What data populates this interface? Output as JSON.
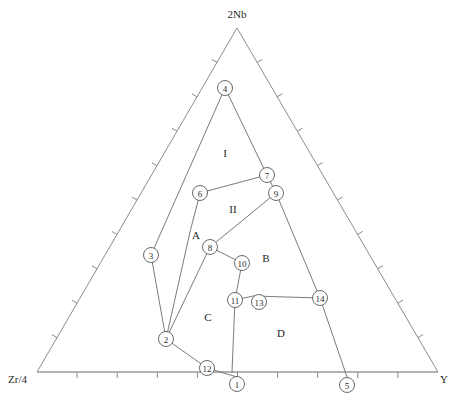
{
  "figure": {
    "kind": "ternary-phase-diagram",
    "background_color": "#ffffff",
    "line_color": "#6b6b6b",
    "edge_color": "#8c8c8c"
  },
  "corners": {
    "apex": {
      "label": "2Nb",
      "x": 237,
      "y": 14
    },
    "left": {
      "label": "Zr/4",
      "x": 8,
      "y": 379
    },
    "right": {
      "label": "Y",
      "x": 448,
      "y": 379
    }
  },
  "triangle": {
    "apex": {
      "x": 237,
      "y": 28
    },
    "left": {
      "x": 37,
      "y": 372
    },
    "right": {
      "x": 438,
      "y": 372
    },
    "tick_divisions": 10,
    "tick_length": 6
  },
  "region_labels": [
    {
      "text": "I",
      "x": 225,
      "y": 153
    },
    {
      "text": "II",
      "x": 233,
      "y": 209
    },
    {
      "text": "A",
      "x": 196,
      "y": 235
    },
    {
      "text": "B",
      "x": 266,
      "y": 258
    },
    {
      "text": "C",
      "x": 208,
      "y": 317
    },
    {
      "text": "D",
      "x": 281,
      "y": 333
    }
  ],
  "nodes": [
    {
      "id": "1",
      "x": 237,
      "y": 384,
      "r": 7.5
    },
    {
      "id": "2",
      "x": 166,
      "y": 339,
      "r": 7.5
    },
    {
      "id": "3",
      "x": 151,
      "y": 255,
      "r": 7.5
    },
    {
      "id": "4",
      "x": 225,
      "y": 88,
      "r": 7.5
    },
    {
      "id": "5",
      "x": 347,
      "y": 385,
      "r": 7.5
    },
    {
      "id": "6",
      "x": 200,
      "y": 193,
      "r": 7.5
    },
    {
      "id": "7",
      "x": 267,
      "y": 175,
      "r": 7.5
    },
    {
      "id": "8",
      "x": 210,
      "y": 247,
      "r": 7.5
    },
    {
      "id": "9",
      "x": 276,
      "y": 193,
      "r": 7.5
    },
    {
      "id": "10",
      "x": 242,
      "y": 263,
      "r": 7.5
    },
    {
      "id": "11",
      "x": 235,
      "y": 300,
      "r": 7.5
    },
    {
      "id": "12",
      "x": 207,
      "y": 368,
      "r": 7.5
    },
    {
      "id": "13",
      "x": 259,
      "y": 302,
      "r": 7.5
    },
    {
      "id": "14",
      "x": 320,
      "y": 298,
      "r": 7.5
    }
  ],
  "boundaries": [
    {
      "name": "apex-4-to-3-to-2",
      "points": [
        [
          225,
          88
        ],
        [
          151,
          255
        ],
        [
          166,
          339
        ]
      ]
    },
    {
      "name": "node4-to-node7-to-node9",
      "points": [
        [
          225,
          88
        ],
        [
          267,
          175
        ],
        [
          276,
          193
        ]
      ]
    },
    {
      "name": "node6-to-node7",
      "points": [
        [
          200,
          193
        ],
        [
          267,
          175
        ]
      ]
    },
    {
      "name": "node6-to-node2",
      "points": [
        [
          200,
          193
        ],
        [
          190,
          232
        ],
        [
          166,
          339
        ]
      ]
    },
    {
      "name": "node9-to-node8-to-node2",
      "points": [
        [
          276,
          193
        ],
        [
          210,
          247
        ],
        [
          166,
          339
        ]
      ]
    },
    {
      "name": "node9-to-node14-to-node5",
      "points": [
        [
          276,
          193
        ],
        [
          320,
          298
        ],
        [
          347,
          377
        ]
      ]
    },
    {
      "name": "node8-to-node10-to-node11",
      "points": [
        [
          210,
          247
        ],
        [
          242,
          263
        ],
        [
          235,
          300
        ]
      ]
    },
    {
      "name": "node11-to-bottom-axis",
      "points": [
        [
          235,
          300
        ],
        [
          232,
          372
        ]
      ]
    },
    {
      "name": "node2-to-node12-to-node1",
      "points": [
        [
          166,
          339
        ],
        [
          207,
          368
        ],
        [
          237,
          377
        ]
      ]
    },
    {
      "name": "node11-to-node13-to-node14",
      "points": [
        [
          235,
          300
        ],
        [
          253,
          296
        ],
        [
          320,
          298
        ]
      ]
    }
  ]
}
